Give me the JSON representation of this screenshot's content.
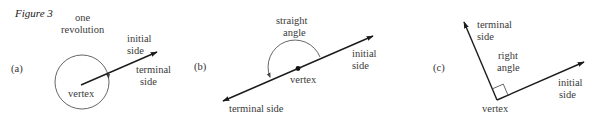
{
  "figure": {
    "title": "Figure 3",
    "panels": [
      {
        "id": "a",
        "label": "(a)",
        "angle_label": [
          "one",
          "revolution"
        ],
        "initial_side": [
          "initial",
          "side"
        ],
        "terminal_side": [
          "terminal",
          "side"
        ],
        "vertex": "vertex"
      },
      {
        "id": "b",
        "label": "(b)",
        "angle_label": [
          "straight",
          "angle"
        ],
        "initial_side": [
          "initial",
          "side"
        ],
        "terminal_side": "terminal side",
        "vertex": "vertex"
      },
      {
        "id": "c",
        "label": "(c)",
        "angle_label": [
          "right",
          "angle"
        ],
        "initial_side": [
          "initial",
          "side"
        ],
        "terminal_side": [
          "terminal",
          "side"
        ],
        "vertex": "vertex"
      }
    ]
  }
}
